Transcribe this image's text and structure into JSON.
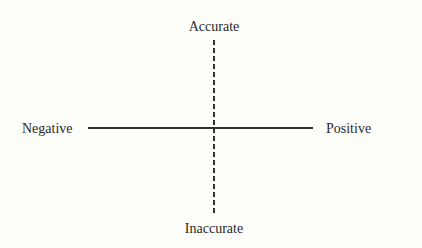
{
  "diagram": {
    "type": "quadrant-axes",
    "axes": {
      "horizontal": {
        "style": "solid",
        "left_label": "Negative",
        "right_label": "Positive"
      },
      "vertical": {
        "style": "dashed",
        "top_label": "Accurate",
        "bottom_label": "Inaccurate"
      }
    },
    "colors": {
      "background": "#fdfdf9",
      "line": "#2f2f2f",
      "text": "#2a2a2a"
    }
  }
}
